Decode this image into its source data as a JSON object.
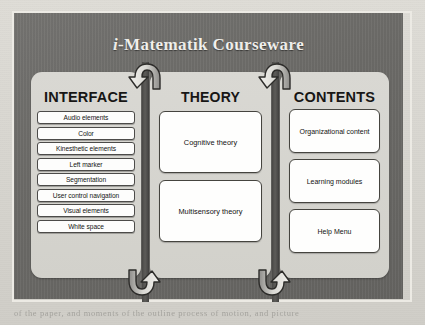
{
  "page": {
    "background_color": "#d8d6d0",
    "bleed_lines": [
      "of the paper, and moments of the outline process of motion, and picture",
      "centres  among  means  a  section  general  in  version  for  one  the"
    ]
  },
  "diagram": {
    "frame_color": "#6c6b68",
    "panel_color": "#d6d5d0",
    "accent_color": "#4a4947",
    "title": {
      "italic_prefix": "i",
      "rest": "-Matematik Courseware",
      "full": "i-Matematik Courseware"
    },
    "columns": [
      {
        "id": "interface",
        "heading": "INTERFACE",
        "items": [
          "Audio elements",
          "Color",
          "Kinesthetic elements",
          "Left marker",
          "Segmentation",
          "User control navigation",
          "Visual elements",
          "White space"
        ]
      },
      {
        "id": "theory",
        "heading": "THEORY",
        "items": [
          "Cognitive theory",
          "Multisensory theory"
        ]
      },
      {
        "id": "contents",
        "heading": "CONTENTS",
        "items": [
          "Organizational content",
          "Learning modules",
          "Help Menu"
        ]
      }
    ],
    "connectors": [
      {
        "id": "top-left",
        "direction": "curve-right-to-left",
        "links": "theory-to-interface"
      },
      {
        "id": "top-right",
        "direction": "curve-right-to-left",
        "links": "contents-to-theory"
      },
      {
        "id": "bottom-left",
        "direction": "curve-left-to-right",
        "links": "interface-to-theory"
      },
      {
        "id": "bottom-right",
        "direction": "curve-left-to-right",
        "links": "theory-to-contents"
      }
    ]
  }
}
